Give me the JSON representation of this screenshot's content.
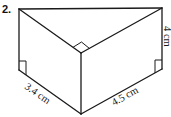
{
  "problem": {
    "number": "2."
  },
  "figure": {
    "shape": "triangular-prism",
    "labels": {
      "height": "4 cm",
      "base_left": "3.4 cm",
      "base_right": "4.5 cm"
    },
    "right_angle_markers": 3,
    "stroke_color": "#1a1a1a",
    "background_color": "#ffffff"
  }
}
